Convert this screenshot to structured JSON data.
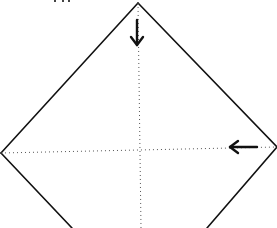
{
  "diagram": {
    "type": "origami-fold-diagram",
    "colors": {
      "background": "#ffffff",
      "edge": "#111111",
      "crease": "#555555",
      "arrow": "#111111"
    },
    "paper": {
      "shape": "diamond",
      "corners": {
        "top": [
          138,
          3
        ],
        "left": [
          1,
          153
        ],
        "right": [
          277,
          147
        ],
        "bottom_left_exit": [
          72,
          228
        ],
        "bottom_right_exit": [
          207,
          228
        ]
      }
    },
    "creases": [
      {
        "name": "vertical-valley-crease",
        "style": "dotted",
        "from": [
          138,
          3
        ],
        "to": [
          141,
          228
        ]
      },
      {
        "name": "horizontal-valley-crease",
        "style": "dotted",
        "from": [
          1,
          153
        ],
        "to": [
          277,
          147
        ]
      }
    ],
    "arrows": [
      {
        "name": "fold-down-arrow",
        "direction": "down",
        "from": [
          137,
          20
        ],
        "to": [
          137,
          46
        ]
      },
      {
        "name": "fold-left-arrow",
        "direction": "left",
        "from": [
          258,
          147
        ],
        "to": [
          229,
          147
        ]
      }
    ]
  }
}
